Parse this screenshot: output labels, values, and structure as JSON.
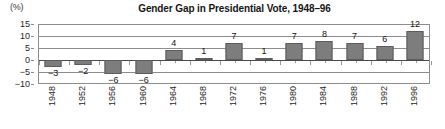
{
  "chart_data": {
    "type": "bar",
    "title": "Gender Gap in Presidential Vote, 1948–96",
    "unit_label": "(%)",
    "xlabel": "",
    "ylabel": "(%)",
    "categories": [
      "1948",
      "1952",
      "1956",
      "1960",
      "1964",
      "1968",
      "1972",
      "1976",
      "1980",
      "1984",
      "1988",
      "1992",
      "1996"
    ],
    "values": [
      -3,
      -2,
      -6,
      -6,
      4,
      1,
      7,
      1,
      7,
      8,
      7,
      6,
      12
    ],
    "value_labels": [
      "−3",
      "−2",
      "−6",
      "−6",
      "4",
      "1",
      "7",
      "1",
      "7",
      "8",
      "7",
      "6",
      "12"
    ],
    "ylim": [
      -10,
      15
    ],
    "yticks": [
      15,
      10,
      5,
      0,
      -5,
      -10
    ],
    "ytick_labels": [
      "15",
      "10",
      "5",
      "0",
      "−5",
      "−10"
    ],
    "grid": true,
    "legend": "none",
    "bar_color": "#7d7d7d",
    "bar_border_color": "#5d5d5d",
    "axis_color": "#8d8d8d",
    "zero_line_color": "#4a4a4a",
    "background": "#ffffff"
  }
}
